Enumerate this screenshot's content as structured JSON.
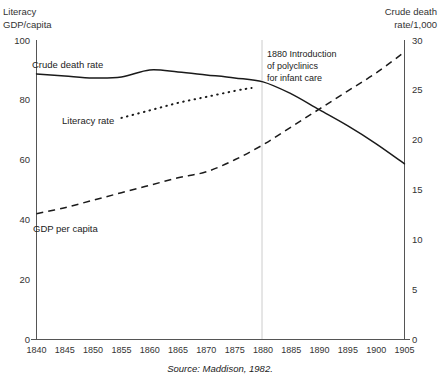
{
  "figure": {
    "top_title_fragment": "",
    "left_axis_title_line1": "Literacy",
    "left_axis_title_line2": "GDP/capita",
    "right_axis_title_line1": "Crude death",
    "right_axis_title_line2": "rate/1,000",
    "source_note": "Source: Maddison, 1982.",
    "annotation": {
      "line1": "1880 Introduction",
      "line2": "of polyclinics",
      "line3": "for infant care",
      "year": 1880
    },
    "ink_color": "#1a1a1a",
    "axis_color": "#555555",
    "marker_color": "#cccccc"
  },
  "chart_data": {
    "type": "line",
    "title": "",
    "subtitle": "",
    "xlabel": "",
    "ylabel": "Literacy / GDP/capita",
    "y2label": "Crude death rate/1,000",
    "xlim": [
      1840,
      1905
    ],
    "ylim": [
      0,
      100
    ],
    "y2lim": [
      0,
      30
    ],
    "grid": false,
    "legend": "inline-labels",
    "x_ticks": [
      1840,
      1845,
      1850,
      1855,
      1860,
      1865,
      1870,
      1875,
      1880,
      1885,
      1890,
      1895,
      1900,
      1905
    ],
    "y_ticks": [
      0,
      20,
      40,
      60,
      80,
      100
    ],
    "y2_ticks": [
      0,
      5,
      10,
      15,
      20,
      25,
      30
    ],
    "annotations": [
      {
        "x": 1880,
        "text": "1880 Introduction of polyclinics for infant care",
        "type": "vertical-marker"
      }
    ],
    "series": [
      {
        "name": "Crude death rate",
        "axis": "right",
        "style": "solid",
        "label_x": 1843,
        "label_y": 27.8,
        "x": [
          1840,
          1845,
          1850,
          1855,
          1860,
          1865,
          1870,
          1875,
          1880,
          1885,
          1890,
          1895,
          1900,
          1905
        ],
        "values": [
          26.6,
          26.4,
          26.2,
          26.3,
          27.0,
          26.8,
          26.5,
          26.2,
          25.8,
          24.6,
          23.0,
          21.4,
          19.6,
          17.6
        ]
      },
      {
        "name": "GDP per capita",
        "axis": "left",
        "style": "dashed",
        "label_x": 1842,
        "label_y": 36,
        "x": [
          1840,
          1845,
          1850,
          1855,
          1860,
          1865,
          1870,
          1875,
          1880,
          1885,
          1890,
          1895,
          1900,
          1905
        ],
        "values": [
          42,
          44,
          46.5,
          49,
          51.5,
          54,
          56,
          60,
          65,
          71,
          77,
          83,
          89,
          96
        ]
      },
      {
        "name": "Literacy rate",
        "axis": "left",
        "style": "dotted",
        "label_x": 1847,
        "label_y": 73,
        "x": [
          1855,
          1860,
          1865,
          1870,
          1875,
          1878
        ],
        "values": [
          74,
          76.5,
          79,
          81,
          83,
          84
        ]
      }
    ]
  }
}
